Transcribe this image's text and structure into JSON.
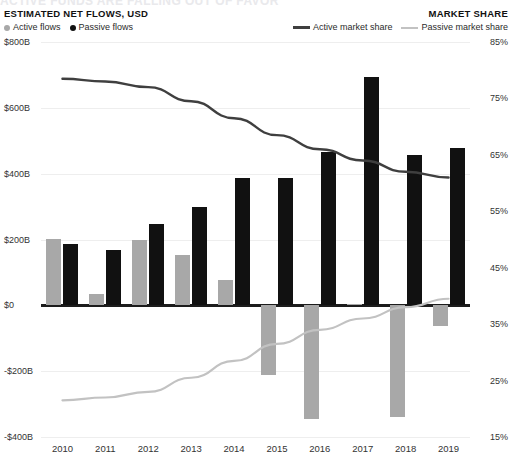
{
  "cut_title": "ACTIVE FUNDS ARE FALLING OUT OF FAVOR",
  "header": {
    "left_title": "ESTIMATED NET FLOWS, USD",
    "right_title": "MARKET SHARE",
    "legend_bars": [
      {
        "label": "Active flows",
        "color": "#a8a8a8",
        "marker": "dot"
      },
      {
        "label": "Passive flows",
        "color": "#111111",
        "marker": "dot"
      }
    ],
    "legend_lines": [
      {
        "label": "Active market share",
        "color": "#3f3f3f",
        "marker": "dash"
      },
      {
        "label": "Passive market share",
        "color": "#c2c2c2",
        "marker": "dash"
      }
    ]
  },
  "chart_data": {
    "type": "bar",
    "title": "ESTIMATED NET FLOWS, USD",
    "xlabel": "",
    "ylabel": "Estimated net flows, USD",
    "y2label": "Market share",
    "grid": true,
    "legend_position": "top",
    "categories": [
      "2010",
      "2011",
      "2012",
      "2013",
      "2014",
      "2015",
      "2016",
      "2017",
      "2018",
      "2019"
    ],
    "ylim": [
      -400,
      800
    ],
    "yticks": [
      800,
      600,
      400,
      200,
      0,
      -200,
      -400
    ],
    "ytick_labels": [
      "$800B",
      "$600B",
      "$400B",
      "$200B",
      "$0",
      "-$200B",
      "-$400B"
    ],
    "y2lim": [
      15,
      85
    ],
    "y2ticks": [
      85,
      75,
      65,
      55,
      45,
      35,
      25,
      15
    ],
    "y2tick_labels": [
      "85%",
      "75%",
      "65%",
      "55%",
      "45%",
      "35%",
      "25%",
      "15%"
    ],
    "series": [
      {
        "name": "Active flows",
        "type": "bar",
        "axis": "left",
        "units": "USD billions",
        "color": "#a8a8a8",
        "values": [
          203,
          33,
          198,
          152,
          76,
          -213,
          -345,
          5,
          -340,
          -62
        ]
      },
      {
        "name": "Passive flows",
        "type": "bar",
        "axis": "left",
        "units": "USD billions",
        "color": "#111111",
        "values": [
          185,
          167,
          248,
          300,
          386,
          386,
          465,
          694,
          456,
          477
        ]
      },
      {
        "name": "Active market share",
        "type": "line",
        "axis": "right",
        "units": "percent",
        "color": "#3f3f3f",
        "values": [
          78.5,
          78.0,
          77.0,
          74.5,
          71.5,
          68.5,
          66.0,
          64.0,
          62.0,
          61.0
        ]
      },
      {
        "name": "Passive market share",
        "type": "line",
        "axis": "right",
        "units": "percent",
        "color": "#c2c2c2",
        "values": [
          21.5,
          22.0,
          23.0,
          25.5,
          28.5,
          31.5,
          34.0,
          36.0,
          38.0,
          39.5
        ]
      }
    ]
  }
}
